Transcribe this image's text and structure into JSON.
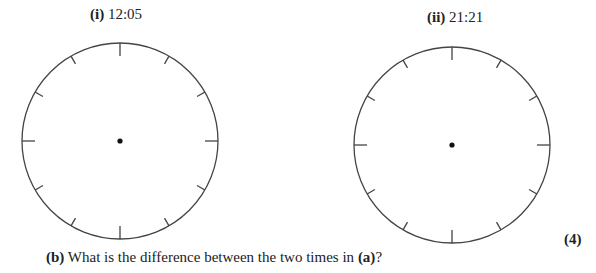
{
  "clocks": [
    {
      "label_num": "(i)",
      "time": "12:05"
    },
    {
      "label_num": "(ii)",
      "time": "21:21"
    }
  ],
  "marks": "(4)",
  "question": {
    "part": "(b)",
    "text_before": " What is the difference between the two times in ",
    "ref": "(a)",
    "text_after": "?"
  }
}
